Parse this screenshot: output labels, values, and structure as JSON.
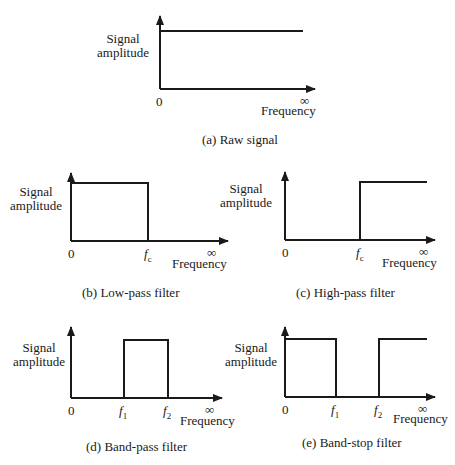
{
  "axis_labels": {
    "y_line1": "Signal",
    "y_line2": "amplitude",
    "x": "Frequency",
    "origin": "0",
    "infinity": "∞"
  },
  "panels": [
    {
      "id": "a",
      "caption": "(a) Raw signal",
      "type": "raw",
      "markers": []
    },
    {
      "id": "b",
      "caption": "(b) Low-pass filter",
      "type": "low-pass",
      "markers": [
        {
          "base": "f",
          "sub": "c"
        }
      ]
    },
    {
      "id": "c",
      "caption": "(c) High-pass filter",
      "type": "high-pass",
      "markers": [
        {
          "base": "f",
          "sub": "c"
        }
      ]
    },
    {
      "id": "d",
      "caption": "(d) Band-pass filter",
      "type": "band-pass",
      "markers": [
        {
          "base": "f",
          "sub": "1"
        },
        {
          "base": "f",
          "sub": "2"
        }
      ]
    },
    {
      "id": "e",
      "caption": "(e) Band-stop filter",
      "type": "band-stop",
      "markers": [
        {
          "base": "f",
          "sub": "1"
        },
        {
          "base": "f",
          "sub": "2"
        }
      ]
    }
  ],
  "colors": {
    "line": "#1a1a1a",
    "background": "#ffffff"
  }
}
